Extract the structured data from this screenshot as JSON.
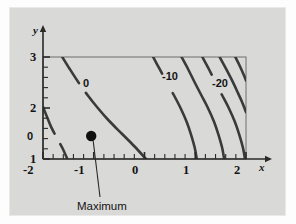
{
  "figure": {
    "kind": "contour-plot",
    "background_outer": "#fdfdfd",
    "background_plot": "#d9d9d7",
    "frame_border": "#e9e9e9",
    "axis_color": "#2a2a2a",
    "contour_color": "#3a3a3a"
  },
  "axes": {
    "x": {
      "name": "x",
      "ticks": [
        "-2",
        "-1",
        "0",
        "1",
        "2"
      ],
      "tick_values": [
        -2,
        -1,
        0,
        1,
        2
      ],
      "range": [
        -2,
        2
      ],
      "minor_per_unit": 5,
      "arrow": true
    },
    "y": {
      "name": "y",
      "ticks": [
        "3",
        "2",
        "1"
      ],
      "tick_values": [
        3,
        2,
        1
      ],
      "range": [
        1,
        3
      ],
      "minor_per_unit": 5,
      "arrow": true
    }
  },
  "annotations": {
    "maximum_label": "Maximum",
    "maximum_point": {
      "x": -1.05,
      "y": 1.45
    }
  },
  "chart_data": {
    "type": "line",
    "title": "",
    "xlabel": "x",
    "ylabel": "y",
    "xlim": [
      -2,
      2
    ],
    "ylim": [
      1,
      3
    ],
    "grid": false,
    "legend": "none",
    "contour_labels": [
      "0",
      "0",
      "-10",
      "-20"
    ],
    "series": [
      {
        "name": "level-0-lower-left",
        "level": 0,
        "label": "0",
        "label_at": {
          "x": -1.87,
          "y": 1.32
        },
        "points": [
          {
            "x": -2.0,
            "y": 2.02
          },
          {
            "x": -1.93,
            "y": 1.85
          },
          {
            "x": -1.84,
            "y": 1.63
          },
          {
            "x": -1.73,
            "y": 1.42
          },
          {
            "x": -1.62,
            "y": 1.22
          },
          {
            "x": -1.52,
            "y": 1.0
          }
        ]
      },
      {
        "name": "level-0-main",
        "level": 0,
        "label": "0",
        "label_at": {
          "x": -1.25,
          "y": 2.37
        },
        "points": [
          {
            "x": -1.62,
            "y": 3.0
          },
          {
            "x": -1.47,
            "y": 2.76
          },
          {
            "x": -1.3,
            "y": 2.5
          },
          {
            "x": -1.12,
            "y": 2.25
          },
          {
            "x": -0.92,
            "y": 2.0
          },
          {
            "x": -0.7,
            "y": 1.75
          },
          {
            "x": -0.45,
            "y": 1.5
          },
          {
            "x": -0.2,
            "y": 1.25
          },
          {
            "x": 0.03,
            "y": 1.0
          }
        ]
      },
      {
        "name": "level-minus-10",
        "level": -10,
        "label": "-10",
        "label_at": {
          "x": 0.52,
          "y": 2.52
        },
        "points": [
          {
            "x": 0.17,
            "y": 3.0
          },
          {
            "x": 0.3,
            "y": 2.76
          },
          {
            "x": 0.44,
            "y": 2.5
          },
          {
            "x": 0.58,
            "y": 2.25
          },
          {
            "x": 0.71,
            "y": 2.0
          },
          {
            "x": 0.83,
            "y": 1.73
          },
          {
            "x": 0.92,
            "y": 1.47
          },
          {
            "x": 0.99,
            "y": 1.22
          },
          {
            "x": 1.03,
            "y": 1.0
          }
        ]
      },
      {
        "name": "level-minus-15",
        "level": -15,
        "label": "",
        "points": [
          {
            "x": 0.73,
            "y": 3.0
          },
          {
            "x": 0.86,
            "y": 2.76
          },
          {
            "x": 0.99,
            "y": 2.5
          },
          {
            "x": 1.12,
            "y": 2.25
          },
          {
            "x": 1.25,
            "y": 2.0
          },
          {
            "x": 1.37,
            "y": 1.73
          },
          {
            "x": 1.46,
            "y": 1.47
          },
          {
            "x": 1.53,
            "y": 1.22
          },
          {
            "x": 1.57,
            "y": 1.0
          }
        ]
      },
      {
        "name": "level-minus-20",
        "level": -20,
        "label": "-20",
        "label_at": {
          "x": 1.5,
          "y": 2.5
        },
        "points": [
          {
            "x": 1.14,
            "y": 3.0
          },
          {
            "x": 1.27,
            "y": 2.76
          },
          {
            "x": 1.4,
            "y": 2.5
          },
          {
            "x": 1.53,
            "y": 2.25
          },
          {
            "x": 1.66,
            "y": 2.0
          },
          {
            "x": 1.78,
            "y": 1.73
          },
          {
            "x": 1.87,
            "y": 1.47
          },
          {
            "x": 1.94,
            "y": 1.22
          },
          {
            "x": 1.98,
            "y": 1.0
          }
        ]
      },
      {
        "name": "level-minus-25",
        "level": -25,
        "label": "",
        "points": [
          {
            "x": 1.48,
            "y": 3.0
          },
          {
            "x": 1.6,
            "y": 2.78
          },
          {
            "x": 1.72,
            "y": 2.55
          },
          {
            "x": 1.83,
            "y": 2.32
          },
          {
            "x": 1.93,
            "y": 2.1
          },
          {
            "x": 2.0,
            "y": 1.92
          }
        ]
      },
      {
        "name": "level-minus-30",
        "level": -30,
        "label": "",
        "points": [
          {
            "x": 1.79,
            "y": 3.0
          },
          {
            "x": 1.88,
            "y": 2.82
          },
          {
            "x": 1.96,
            "y": 2.64
          },
          {
            "x": 2.0,
            "y": 2.54
          }
        ]
      }
    ]
  }
}
